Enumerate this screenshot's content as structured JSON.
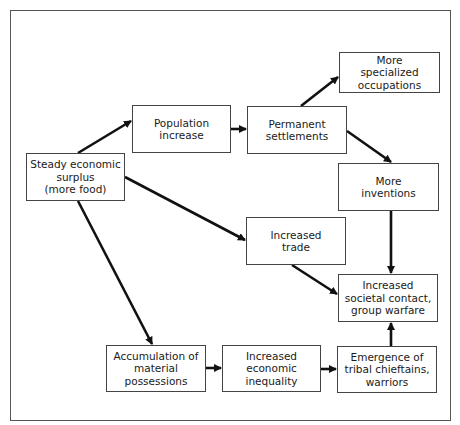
{
  "diagram": {
    "type": "flowchart",
    "nodes": [
      {
        "id": "surplus",
        "label": "Steady economic\nsurplus\n(more food)",
        "x": 26,
        "y": 153,
        "w": 99,
        "h": 48
      },
      {
        "id": "population",
        "label": "Population\nincrease",
        "x": 132,
        "y": 105,
        "w": 99,
        "h": 48
      },
      {
        "id": "settlements",
        "label": "Permanent\nsettlements",
        "x": 247,
        "y": 106,
        "w": 100,
        "h": 48
      },
      {
        "id": "specialized",
        "label": "More\nspecialized\noccupations",
        "x": 339,
        "y": 52,
        "w": 101,
        "h": 41
      },
      {
        "id": "inventions",
        "label": "More\ninventions",
        "x": 338,
        "y": 163,
        "w": 101,
        "h": 48
      },
      {
        "id": "trade",
        "label": "Increased\ntrade",
        "x": 246,
        "y": 217,
        "w": 100,
        "h": 48
      },
      {
        "id": "contact",
        "label": "Increased\nsocietal contact,\ngroup warfare",
        "x": 338,
        "y": 274,
        "w": 100,
        "h": 48
      },
      {
        "id": "accumulation",
        "label": "Accumulation of\nmaterial possessions",
        "x": 106,
        "y": 345,
        "w": 100,
        "h": 47
      },
      {
        "id": "inequality",
        "label": "Increased economic\ninequality",
        "x": 222,
        "y": 345,
        "w": 99,
        "h": 47
      },
      {
        "id": "chieftains",
        "label": "Emergence of\ntribal chieftains,\nwarriors",
        "x": 337,
        "y": 346,
        "w": 100,
        "h": 47
      }
    ],
    "edges": [
      {
        "from": "surplus",
        "to": "population",
        "x1": 78,
        "y1": 153,
        "x2": 131,
        "y2": 121
      },
      {
        "from": "surplus",
        "to": "trade",
        "x1": 125,
        "y1": 177,
        "x2": 245,
        "y2": 240
      },
      {
        "from": "surplus",
        "to": "accumulation",
        "x1": 78,
        "y1": 201,
        "x2": 152,
        "y2": 344
      },
      {
        "from": "population",
        "to": "settlements",
        "x1": 231,
        "y1": 129,
        "x2": 246,
        "y2": 129
      },
      {
        "from": "settlements",
        "to": "specialized",
        "x1": 301,
        "y1": 106,
        "x2": 338,
        "y2": 77
      },
      {
        "from": "settlements",
        "to": "inventions",
        "x1": 347,
        "y1": 131,
        "x2": 391,
        "y2": 162
      },
      {
        "from": "inventions",
        "to": "contact",
        "x1": 391,
        "y1": 211,
        "x2": 391,
        "y2": 273
      },
      {
        "from": "trade",
        "to": "contact",
        "x1": 292,
        "y1": 265,
        "x2": 337,
        "y2": 294
      },
      {
        "from": "accumulation",
        "to": "inequality",
        "x1": 206,
        "y1": 368,
        "x2": 221,
        "y2": 368
      },
      {
        "from": "inequality",
        "to": "chieftains",
        "x1": 321,
        "y1": 369,
        "x2": 336,
        "y2": 369
      },
      {
        "from": "chieftains",
        "to": "contact",
        "x1": 391,
        "y1": 346,
        "x2": 391,
        "y2": 323
      }
    ],
    "colors": {
      "stroke": "#111111",
      "box_border": "#444444",
      "frame_border": "#555555",
      "text": "#1a1a1a",
      "background": "#ffffff"
    }
  }
}
